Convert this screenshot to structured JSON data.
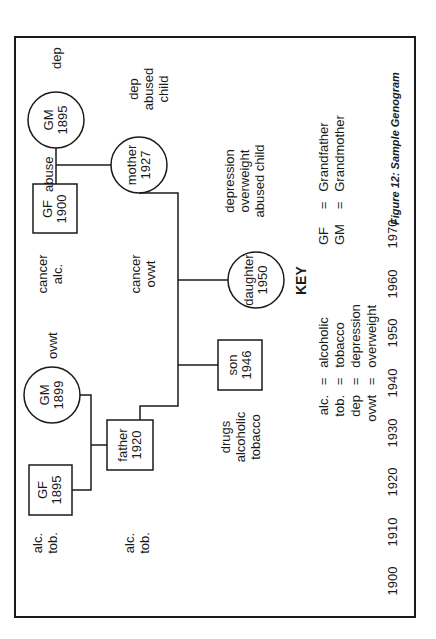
{
  "figure": {
    "caption": "Figure 12: Sample Genogram",
    "orientation": "rotated 90° counter-clockwise"
  },
  "timeline": {
    "years": [
      "1900",
      "1910",
      "1920",
      "1930",
      "1940",
      "1950",
      "1960",
      "1970"
    ]
  },
  "nodes": {
    "gf_paternal": {
      "shape": "square",
      "name": "GF",
      "year": "1895",
      "notes": [
        "alc.",
        "tob."
      ]
    },
    "gm_paternal": {
      "shape": "circle",
      "name": "GM",
      "year": "1899",
      "notes": [
        "ovwt"
      ]
    },
    "gf_maternal": {
      "shape": "square",
      "name": "GF",
      "year": "1900",
      "notes": [
        "cancer",
        "alc."
      ]
    },
    "gm_maternal": {
      "shape": "circle",
      "name": "GM",
      "year": "1895",
      "notes": [
        "dep"
      ]
    },
    "maternal_relationship": "abuse",
    "father": {
      "shape": "square",
      "name": "father",
      "year": "1920",
      "notes": [
        "alc.",
        "tob."
      ]
    },
    "mother": {
      "shape": "circle",
      "name": "mother",
      "year": "1927",
      "notes": [
        "dep",
        "abused",
        "child"
      ]
    },
    "son": {
      "shape": "square",
      "name": "son",
      "year": "1946",
      "notes": [
        "drugs",
        "alcoholic",
        "tobacco"
      ]
    },
    "daughter": {
      "shape": "circle",
      "name": "daughter",
      "year": "1950",
      "notes": [
        "cancer",
        "ovwt"
      ]
    },
    "daughter_extra_notes": [
      "depression",
      "overweight",
      "abused child"
    ]
  },
  "key": {
    "title": "KEY",
    "abbreviations": [
      {
        "abbr": "alc.",
        "eq": "=",
        "meaning": "alcoholic"
      },
      {
        "abbr": "tob.",
        "eq": "=",
        "meaning": "tobacco"
      },
      {
        "abbr": "dep",
        "eq": "=",
        "meaning": "depression"
      },
      {
        "abbr": "ovwt",
        "eq": "=",
        "meaning": "overweight"
      }
    ],
    "relations": [
      {
        "abbr": "GF",
        "eq": "=",
        "meaning": "Grandfather"
      },
      {
        "abbr": "GM",
        "eq": "=",
        "meaning": "Grandmother"
      }
    ]
  }
}
